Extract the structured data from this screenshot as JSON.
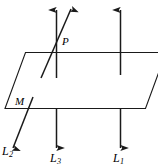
{
  "figure": {
    "type": "geometry-diagram",
    "background_color": "#ffffff",
    "stroke_color": "#1a1a1a",
    "labels": {
      "point_p": "P",
      "plane_m": "M",
      "line_1_letter": "L",
      "line_1_subscript": "1",
      "line_2_letter": "L",
      "line_2_subscript": "2",
      "line_3_letter": "L",
      "line_3_subscript": "3"
    },
    "elements": {
      "plane_name": "plane-M",
      "line1_name": "line-L1",
      "line2_name": "line-L2",
      "line3_name": "line-L3",
      "point_name": "point-P"
    }
  }
}
